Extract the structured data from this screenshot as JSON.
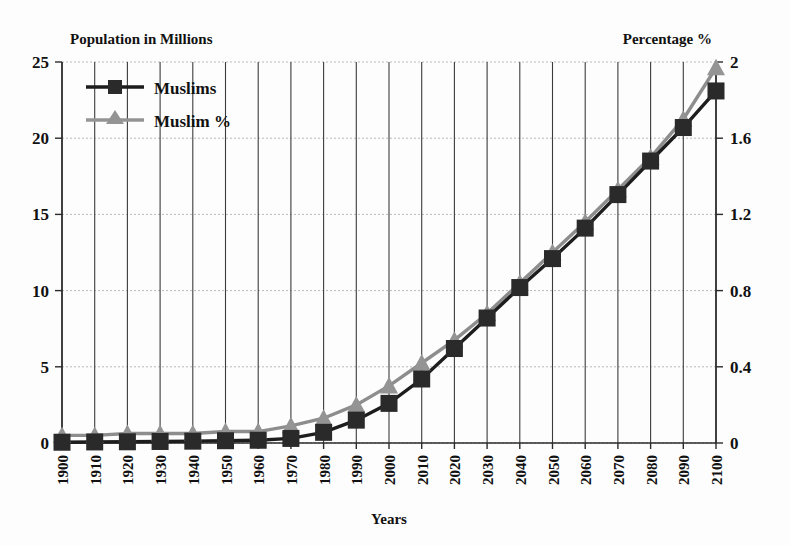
{
  "chart_data": {
    "type": "line",
    "title": "",
    "xlabel": "Years",
    "ylabel": "Population in Millions",
    "y2label": "Percentage %",
    "grid": true,
    "legend_position": "top-left-inside",
    "xlim": [
      1900,
      2100
    ],
    "ylim": [
      0,
      25
    ],
    "y2lim": [
      0,
      2
    ],
    "x": [
      1900,
      1910,
      1920,
      1930,
      1940,
      1950,
      1960,
      1970,
      1980,
      1990,
      2000,
      2010,
      2020,
      2030,
      2040,
      2050,
      2060,
      2070,
      2080,
      2090,
      2100
    ],
    "categories": [
      "1900",
      "1910",
      "1920",
      "1930",
      "1940",
      "1950",
      "1960",
      "1970",
      "1980",
      "1990",
      "2000",
      "2010",
      "2020",
      "2030",
      "2040",
      "2050",
      "2060",
      "2070",
      "2080",
      "2090",
      "2100"
    ],
    "ytick_labels": [
      "0",
      "5",
      "10",
      "15",
      "20",
      "25"
    ],
    "ytick_values": [
      0,
      5,
      10,
      15,
      20,
      25
    ],
    "y2tick_labels": [
      "0",
      "0.4",
      "0.8",
      "1.2",
      "1.6",
      "2"
    ],
    "y2tick_values": [
      0,
      0.4,
      0.8,
      1.2,
      1.6,
      2
    ],
    "series": [
      {
        "name": "Muslims",
        "axis": "left",
        "unit": "millions",
        "color": "#2a2a2a",
        "marker": "square",
        "values": [
          0.05,
          0.07,
          0.08,
          0.1,
          0.12,
          0.15,
          0.18,
          0.3,
          0.7,
          1.5,
          2.6,
          4.2,
          6.2,
          8.2,
          10.2,
          12.1,
          14.1,
          16.3,
          18.5,
          20.7,
          23.1
        ]
      },
      {
        "name": "Muslim %",
        "axis": "right",
        "unit": "percent",
        "color": "#949494",
        "marker": "triangle",
        "values": [
          0.04,
          0.04,
          0.05,
          0.05,
          0.05,
          0.06,
          0.06,
          0.09,
          0.13,
          0.2,
          0.3,
          0.42,
          0.54,
          0.68,
          0.84,
          1.0,
          1.16,
          1.33,
          1.5,
          1.7,
          1.97
        ]
      }
    ]
  },
  "labels": {
    "left_axis_title": "Population in Millions",
    "right_axis_title": "Percentage %",
    "x_axis_title": "Years"
  },
  "legend": {
    "items": [
      {
        "label": "Muslims"
      },
      {
        "label": "Muslim %"
      }
    ]
  }
}
